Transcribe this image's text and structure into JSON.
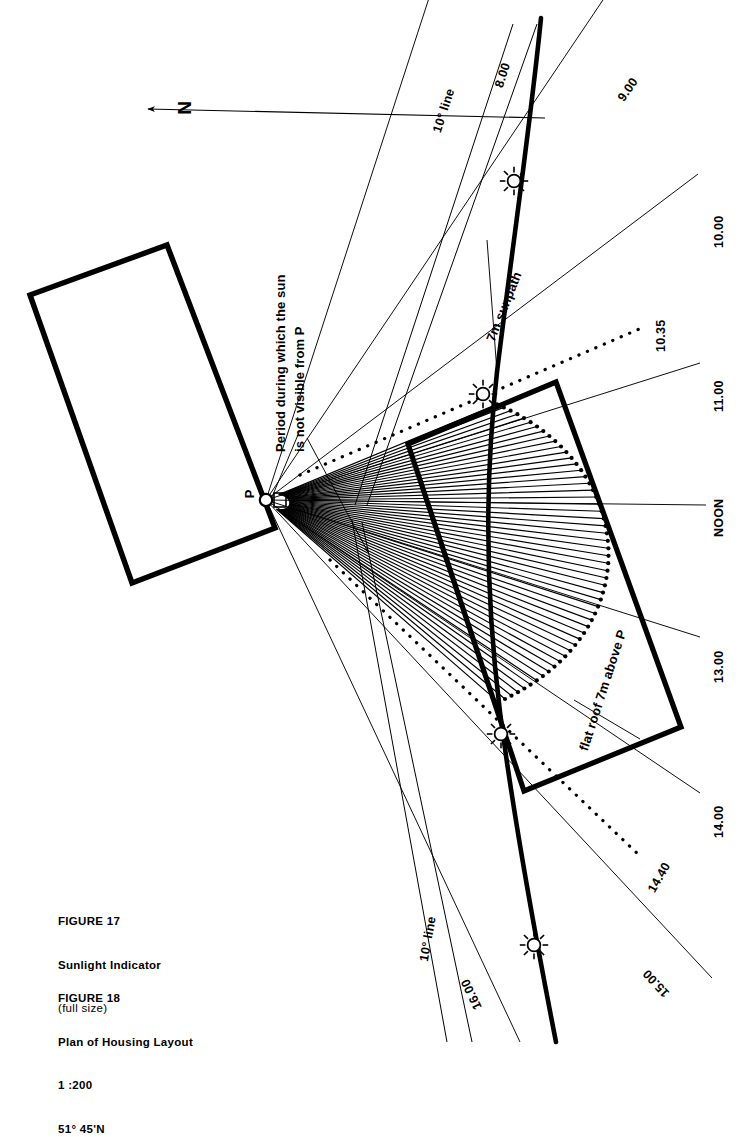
{
  "figure": {
    "title_17": "FIGURE 17",
    "subtitle_17": "Sunlight Indicator",
    "note_17": "(full size)",
    "title_18": "FIGURE 18",
    "subtitle_18": "Plan of Housing Layout",
    "scale_18": "1 :200",
    "latitude_18": "51° 45'N"
  },
  "compass": {
    "north_label": "N",
    "name": "north-arrow"
  },
  "point": {
    "label": "P",
    "x": 266,
    "y": 500
  },
  "annotations": {
    "obstruction": "Period during which the sun\nis not visible from P",
    "obstruction_line1": "Period during which the sun",
    "obstruction_line2": "is not visible from P",
    "sunpath": "7m sunpath",
    "roof": "flat roof 7m above P"
  },
  "degree_lines": [
    {
      "label": "10° line",
      "position": "top"
    },
    {
      "label": "10° line",
      "position": "bottom"
    }
  ],
  "hour_lines": [
    {
      "label": "8.00",
      "style": "solid",
      "angle_deg": -72.0
    },
    {
      "label": "9.00",
      "style": "solid",
      "angle_deg": -56.0
    },
    {
      "label": "10.00",
      "style": "solid",
      "angle_deg": -37.0
    },
    {
      "label": "10.35",
      "style": "dotted",
      "angle_deg": -22.5
    },
    {
      "label": "11.00",
      "style": "solid",
      "angle_deg": -17.5
    },
    {
      "label": "NOON",
      "style": "solid",
      "angle_deg": 0.0
    },
    {
      "label": "13.00",
      "style": "solid",
      "angle_deg": 17.5
    },
    {
      "label": "14.00",
      "style": "solid",
      "angle_deg": 34.0
    },
    {
      "label": "14.40",
      "style": "dotted",
      "angle_deg": 40.0
    },
    {
      "label": "15.00",
      "style": "solid",
      "angle_deg": 47.0
    },
    {
      "label": "16.00",
      "style": "solid",
      "angle_deg": 62.0
    }
  ],
  "suns": [
    {
      "name": "sun-marker-morning",
      "x": 514,
      "y": 181
    },
    {
      "name": "sun-marker-10-35",
      "x": 483,
      "y": 394
    },
    {
      "name": "sun-marker-14-40",
      "x": 501,
      "y": 734
    },
    {
      "name": "sun-marker-afternoon",
      "x": 534,
      "y": 945
    }
  ],
  "buildings": [
    {
      "name": "building-left",
      "description": "rectangular block north-west of P"
    },
    {
      "name": "building-right",
      "description": "flat roof block 7m above P"
    }
  ],
  "colors": {
    "ink": "#000000",
    "thin_line": "#1a1a1a",
    "paper": "#ffffff"
  }
}
